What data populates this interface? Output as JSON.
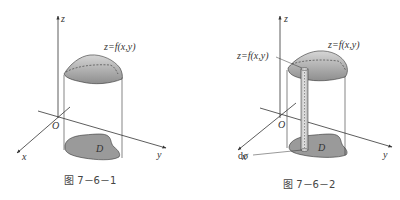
{
  "figures": [
    {
      "caption": "图 7－6－1",
      "labels": {
        "z_axis": "z",
        "x_axis": "x",
        "y_axis": "y",
        "origin": "O",
        "surface": "z=f(x,y)",
        "region": "D"
      }
    },
    {
      "caption": "图 7－6－2",
      "labels": {
        "z_axis": "z",
        "x_axis": "x",
        "y_axis": "y",
        "origin": "O",
        "surface_top": "z=f(x,y)",
        "surface_column": "z=f(x,y)",
        "region": "D",
        "area_element": "dσ"
      }
    }
  ],
  "colors": {
    "line": "#333333",
    "fill_dark": "#9a9a9a",
    "fill_light": "#c8c8c8",
    "background": "#ffffff"
  }
}
